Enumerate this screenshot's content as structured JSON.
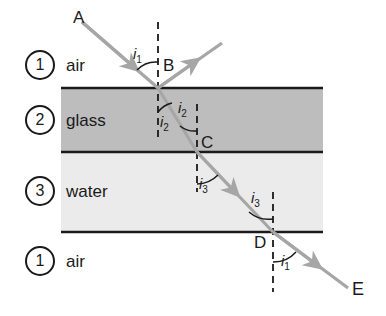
{
  "figure": {
    "ray_color": "#a6a6a6",
    "line_color": "#1a1a1a",
    "glass_fill": "#bdbdbd",
    "water_fill": "#ebebeb",
    "background": "#ffffff"
  },
  "layers": [
    {
      "number": "1",
      "name": "air",
      "position": "top"
    },
    {
      "number": "2",
      "name": "glass",
      "position": "second"
    },
    {
      "number": "3",
      "name": "water",
      "position": "third"
    },
    {
      "number": "1",
      "name": "air",
      "position": "bottom"
    }
  ],
  "points": [
    {
      "id": "A",
      "label": "A",
      "role": "incident-ray-start"
    },
    {
      "id": "B",
      "label": "B",
      "role": "air-glass-interface"
    },
    {
      "id": "C",
      "label": "C",
      "role": "glass-water-interface"
    },
    {
      "id": "D",
      "label": "D",
      "role": "water-air-interface"
    },
    {
      "id": "E",
      "label": "E",
      "role": "emergent-ray-end"
    }
  ],
  "angles": [
    {
      "id": "i1-top",
      "symbol": "i",
      "subscript": "1",
      "at": "B",
      "side": "above-interface",
      "meaning": "angle of incidence in air"
    },
    {
      "id": "i2-left",
      "symbol": "i",
      "subscript": "2",
      "at": "B",
      "side": "below-interface",
      "meaning": "angle of refraction in glass"
    },
    {
      "id": "i2-right",
      "symbol": "i",
      "subscript": "2",
      "at": "C",
      "side": "above-interface",
      "meaning": "angle of incidence in glass"
    },
    {
      "id": "i3-left",
      "symbol": "i",
      "subscript": "3",
      "at": "C",
      "side": "below-interface",
      "meaning": "angle of refraction in water"
    },
    {
      "id": "i3-right",
      "symbol": "i",
      "subscript": "3",
      "at": "D",
      "side": "above-interface",
      "meaning": "angle of incidence in water"
    },
    {
      "id": "i1-bottom",
      "symbol": "i",
      "subscript": "1",
      "at": "D",
      "side": "below-interface",
      "meaning": "angle of emergence in air"
    }
  ],
  "rays": [
    {
      "id": "incident",
      "from": "A",
      "to": "B",
      "medium": "air"
    },
    {
      "id": "reflected",
      "from": "B",
      "to": "reflected-end",
      "medium": "air"
    },
    {
      "id": "in-glass",
      "from": "B",
      "to": "C",
      "medium": "glass"
    },
    {
      "id": "in-water",
      "from": "C",
      "to": "D",
      "medium": "water"
    },
    {
      "id": "emergent",
      "from": "D",
      "to": "E",
      "medium": "air"
    }
  ]
}
